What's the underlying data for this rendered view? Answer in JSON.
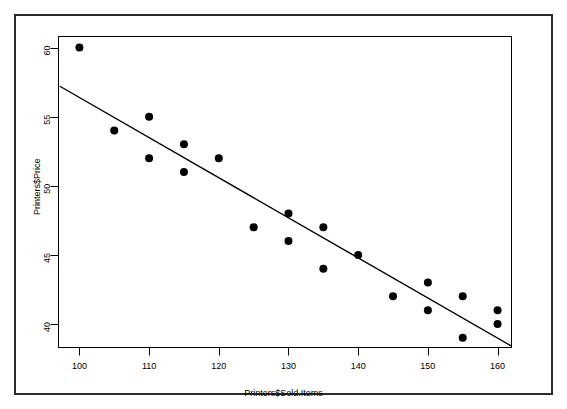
{
  "chart_data": {
    "type": "scatter",
    "title": "",
    "xlabel": "Printers$Sold.Items",
    "ylabel": "Printers$Price",
    "xlim": [
      97,
      162
    ],
    "ylim": [
      38.3,
      60.8
    ],
    "xticks": [
      100,
      110,
      120,
      130,
      140,
      150,
      160
    ],
    "yticks": [
      40,
      45,
      50,
      55,
      60
    ],
    "xtick_labels": [
      "100",
      "110",
      "120",
      "130",
      "140",
      "150",
      "160"
    ],
    "ytick_labels": [
      "40",
      "45",
      "50",
      "55",
      "60"
    ],
    "grid": false,
    "legend": false,
    "point_color": "#000000",
    "point_radius": 4,
    "line_color": "#000000",
    "points": [
      {
        "x": 100,
        "y": 60
      },
      {
        "x": 105,
        "y": 54
      },
      {
        "x": 110,
        "y": 55
      },
      {
        "x": 110,
        "y": 52
      },
      {
        "x": 115,
        "y": 53
      },
      {
        "x": 115,
        "y": 51
      },
      {
        "x": 120,
        "y": 52
      },
      {
        "x": 125,
        "y": 47
      },
      {
        "x": 130,
        "y": 48
      },
      {
        "x": 130,
        "y": 46
      },
      {
        "x": 135,
        "y": 47
      },
      {
        "x": 135,
        "y": 44
      },
      {
        "x": 140,
        "y": 45
      },
      {
        "x": 145,
        "y": 42
      },
      {
        "x": 150,
        "y": 43
      },
      {
        "x": 150,
        "y": 41
      },
      {
        "x": 155,
        "y": 42
      },
      {
        "x": 155,
        "y": 39
      },
      {
        "x": 160,
        "y": 41
      },
      {
        "x": 160,
        "y": 40
      }
    ],
    "series": [
      {
        "name": "regression-line",
        "type": "line",
        "points": [
          {
            "x": 97.2,
            "y": 57.2
          },
          {
            "x": 162,
            "y": 38.4
          }
        ]
      }
    ]
  }
}
